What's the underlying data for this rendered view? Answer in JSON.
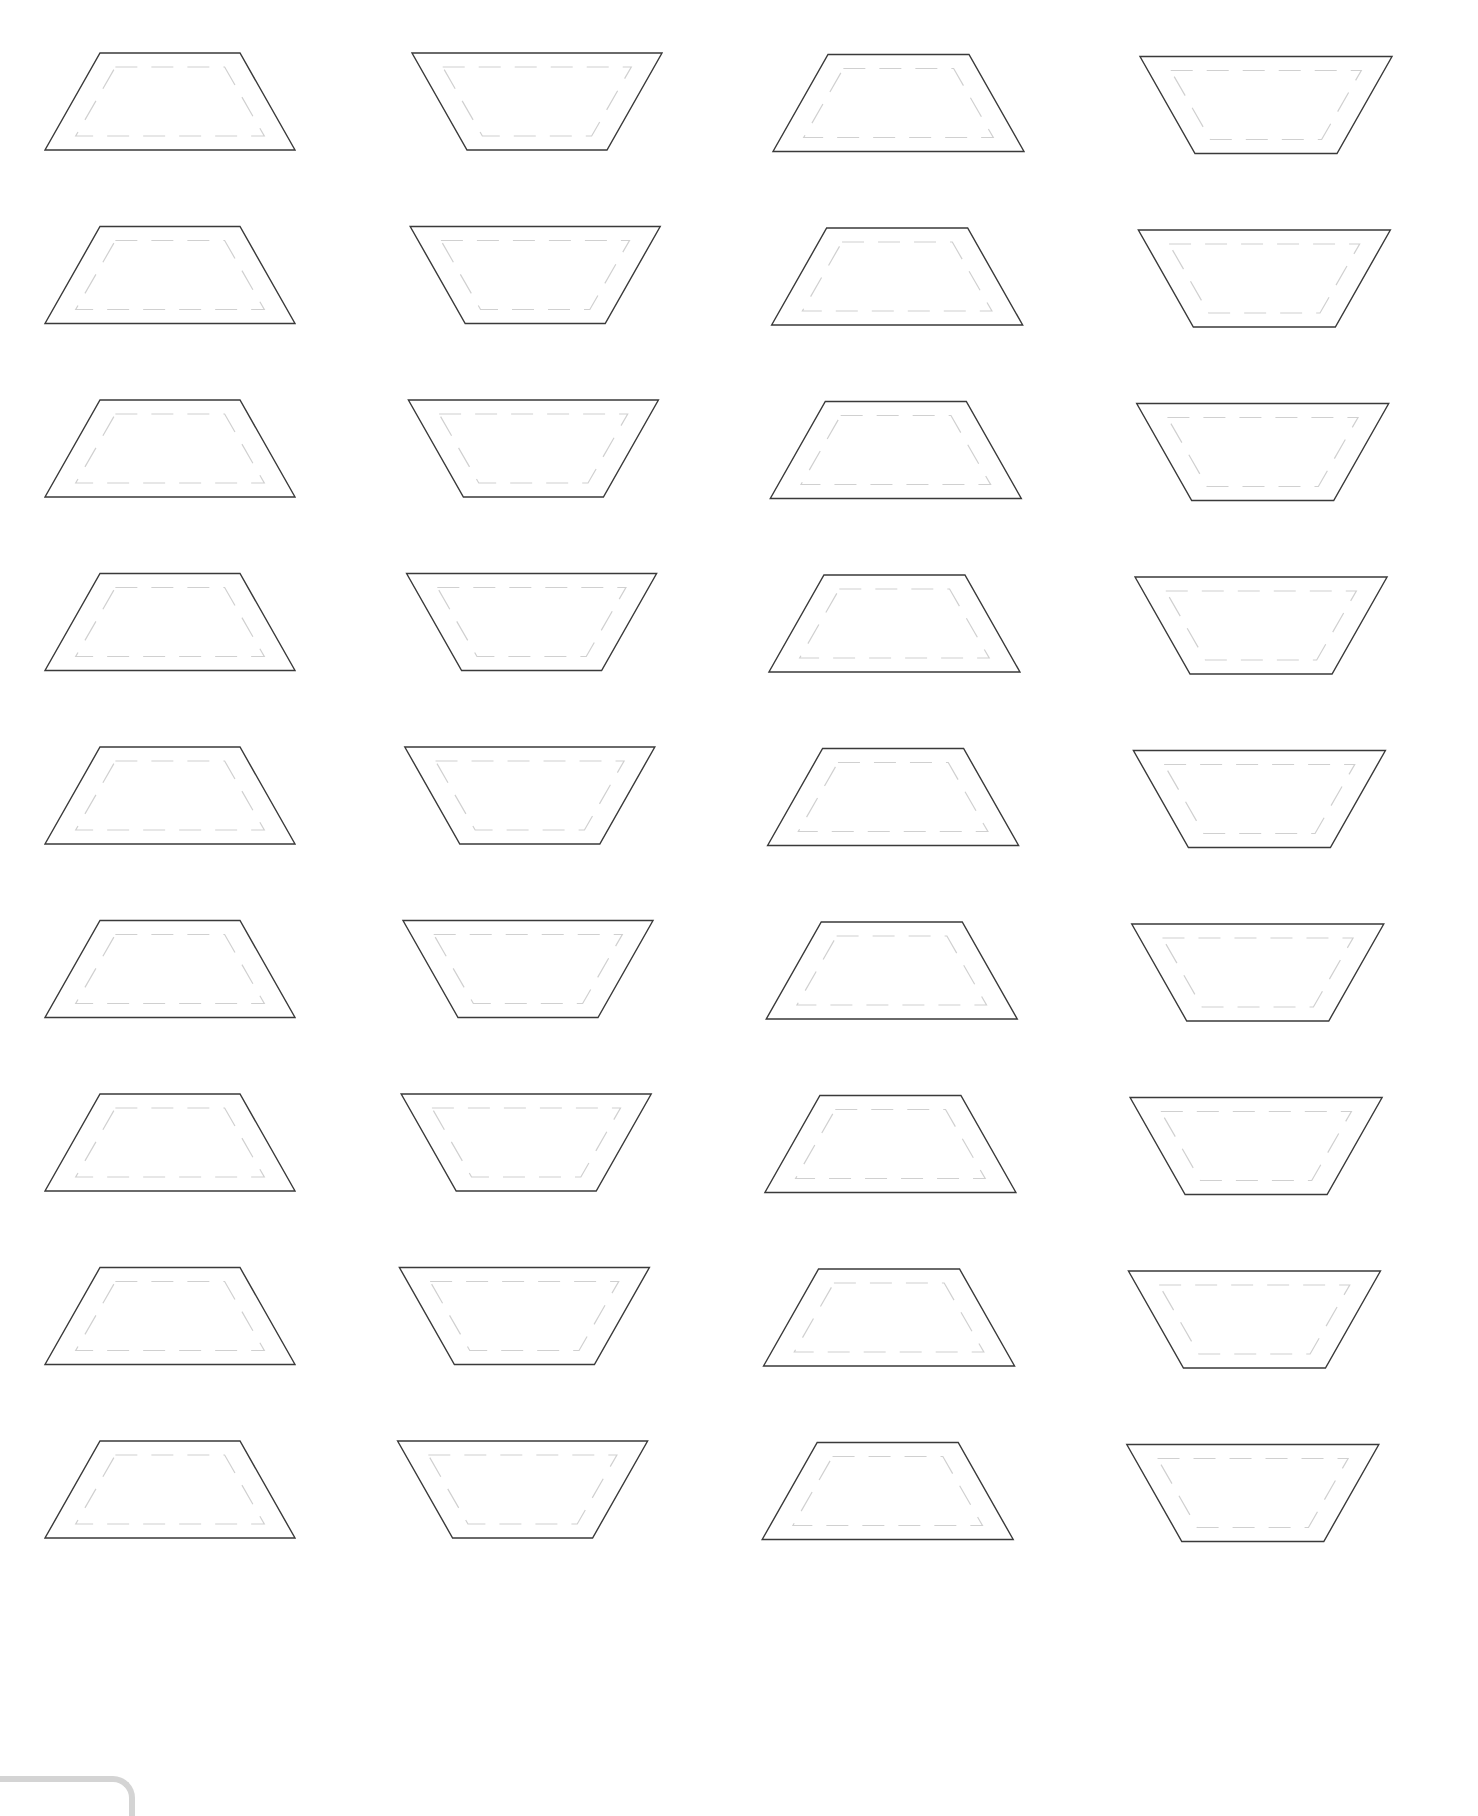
{
  "page": {
    "width": 1478,
    "height": 1793,
    "background": "#ffffff"
  },
  "style": {
    "outline_color": "#3a3a3a",
    "outline_width": 1.4,
    "seam_color": "#d0d0d0",
    "seam_width": 1.2,
    "seam_dash": "22 14",
    "tab_color": "#d4d4d4"
  },
  "grid": {
    "rows": 9,
    "cols": 4,
    "row_pitch": 173.5,
    "first_row_top": 53,
    "shape_height": 97,
    "seam_inset": 14,
    "columns": [
      {
        "orientation": "upright",
        "left": 45,
        "long_width": 250,
        "short_inset": 55,
        "drift_x_per_row": 0.0
      },
      {
        "orientation": "inverted",
        "left": 412,
        "long_width": 250,
        "short_inset": 55,
        "drift_x_per_row": -0.6
      },
      {
        "orientation": "upright",
        "left": 773,
        "long_width": 251,
        "short_inset": 55,
        "drift_x_per_row": -0.45
      },
      {
        "orientation": "inverted",
        "left": 1140,
        "long_width": 252,
        "short_inset": 55,
        "drift_x_per_row": -0.55
      }
    ],
    "column_top_offsets": [
      0,
      0,
      1.5,
      3.5
    ]
  },
  "shapes_label": "trapezoid",
  "corner_tab": {
    "visible": true
  }
}
